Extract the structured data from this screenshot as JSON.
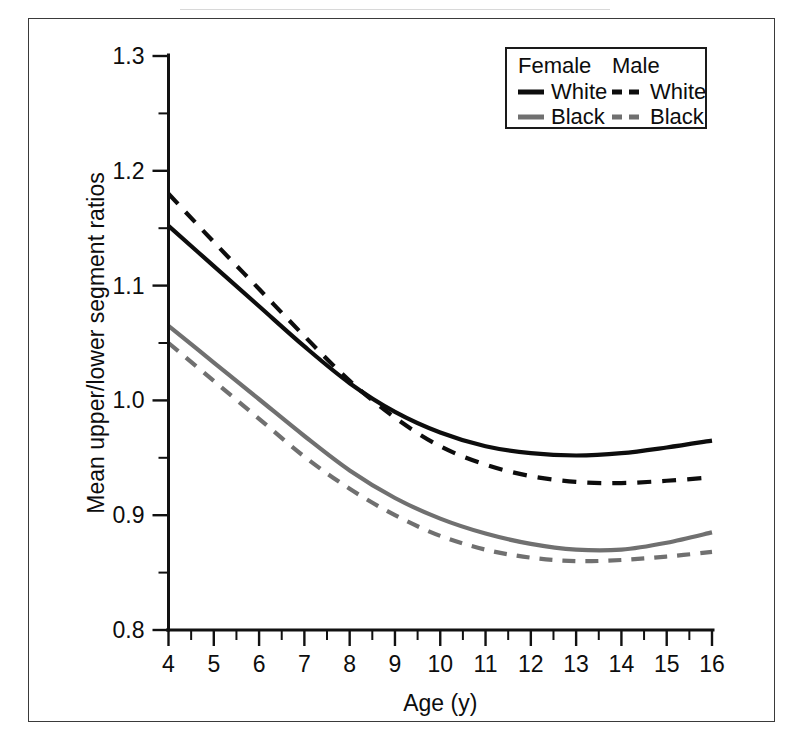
{
  "figure": {
    "frame_color": "#3a3a3a",
    "background": "#ffffff"
  },
  "chart_data": {
    "type": "line",
    "title": "",
    "subtitle": "",
    "xlabel": "Age (y)",
    "ylabel": "Mean upper/lower segment ratios",
    "xlim": [
      4,
      16
    ],
    "ylim": [
      0.8,
      1.3
    ],
    "x_ticks": [
      4,
      5,
      6,
      7,
      8,
      9,
      10,
      11,
      12,
      13,
      14,
      15,
      16
    ],
    "x_tick_labels": [
      "4",
      "5",
      "6",
      "7",
      "8",
      "9",
      "10",
      "11",
      "12",
      "13",
      "14",
      "15",
      "16"
    ],
    "x_minor_step": 0.5,
    "y_ticks": [
      0.8,
      0.9,
      1.0,
      1.1,
      1.2,
      1.3
    ],
    "y_tick_labels": [
      "0.8",
      "0.9",
      "1.0",
      "1.1",
      "1.2",
      "1.3"
    ],
    "y_minor_ticks": [
      0.85,
      0.95,
      1.05,
      1.15,
      1.25
    ],
    "grid": false,
    "legend_position": "top-right",
    "x": [
      4,
      5,
      6,
      7,
      8,
      9,
      10,
      11,
      12,
      13,
      14,
      15,
      16
    ],
    "series": [
      {
        "name": "Female White",
        "group": "Female",
        "race": "White",
        "color": "#0d0d0d",
        "style": "solid",
        "width": 4.2,
        "values": [
          1.152,
          1.117,
          1.082,
          1.047,
          1.015,
          0.99,
          0.972,
          0.96,
          0.954,
          0.952,
          0.954,
          0.959,
          0.965
        ]
      },
      {
        "name": "Male White",
        "group": "Male",
        "race": "White",
        "color": "#0d0d0d",
        "style": "dashed",
        "width": 4.2,
        "dash": "14,11",
        "values": [
          1.18,
          1.138,
          1.097,
          1.056,
          1.017,
          0.985,
          0.96,
          0.944,
          0.934,
          0.929,
          0.928,
          0.93,
          0.933
        ]
      },
      {
        "name": "Female Black",
        "group": "Female",
        "race": "Black",
        "color": "#707070",
        "style": "solid",
        "width": 4.2,
        "values": [
          1.065,
          1.033,
          1.001,
          0.969,
          0.939,
          0.915,
          0.897,
          0.884,
          0.875,
          0.87,
          0.87,
          0.876,
          0.885
        ]
      },
      {
        "name": "Male Black",
        "group": "Male",
        "race": "Black",
        "color": "#707070",
        "style": "dashed",
        "width": 4.2,
        "dash": "13,10",
        "values": [
          1.05,
          1.017,
          0.984,
          0.951,
          0.923,
          0.9,
          0.882,
          0.87,
          0.863,
          0.86,
          0.861,
          0.864,
          0.868
        ]
      }
    ]
  },
  "legend": {
    "col_female_header": "Female",
    "col_male_header": "Male",
    "rows": [
      {
        "label": "White",
        "female_color": "#0d0d0d",
        "female_style": "solid",
        "male_color": "#0d0d0d",
        "male_style": "dashed"
      },
      {
        "label": "Black",
        "female_color": "#707070",
        "female_style": "solid",
        "male_color": "#707070",
        "male_style": "dashed"
      }
    ],
    "female_row_labels": [
      "White",
      "Black"
    ],
    "male_row_labels": [
      "White",
      "Black"
    ]
  }
}
